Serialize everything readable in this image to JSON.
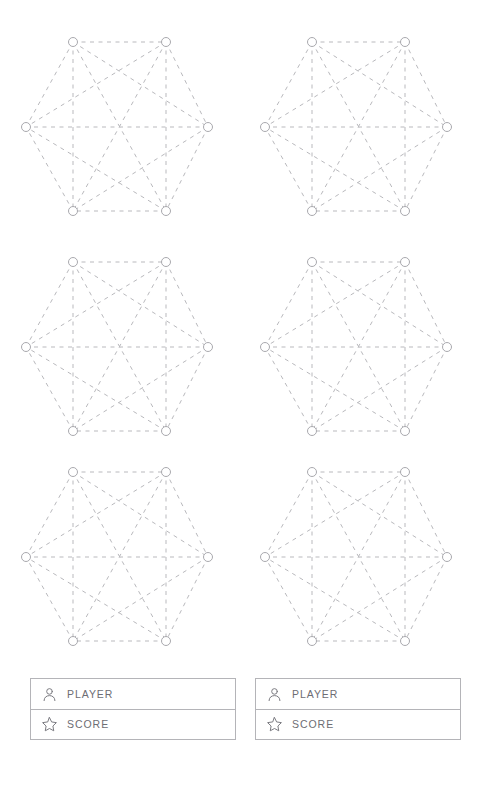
{
  "page": {
    "background_color": "#ffffff",
    "width": 478,
    "height": 792
  },
  "board": {
    "name": "hexagon-graph-board",
    "rows": 3,
    "columns": 2,
    "graph": {
      "type": "complete-graph",
      "label": "K6",
      "vertex_count": 6,
      "edge_count": 15,
      "shape": "hexagon",
      "edge_style": "dashed",
      "edge_color": "#b9b9bd",
      "node_fill": "#ffffff",
      "node_stroke": "#a9a9ae",
      "node_radius": 4.5,
      "vertices": [
        {
          "id": "top-left",
          "x": 73,
          "y": 22
        },
        {
          "id": "top-right",
          "x": 166,
          "y": 22
        },
        {
          "id": "right",
          "x": 208,
          "y": 107
        },
        {
          "id": "bottom-right",
          "x": 166,
          "y": 191
        },
        {
          "id": "bottom-left",
          "x": 73,
          "y": 191
        },
        {
          "id": "left",
          "x": 26,
          "y": 107
        }
      ],
      "edges": [
        [
          0,
          1
        ],
        [
          0,
          2
        ],
        [
          0,
          3
        ],
        [
          0,
          4
        ],
        [
          0,
          5
        ],
        [
          1,
          2
        ],
        [
          1,
          3
        ],
        [
          1,
          4
        ],
        [
          1,
          5
        ],
        [
          2,
          3
        ],
        [
          2,
          4
        ],
        [
          2,
          5
        ],
        [
          3,
          4
        ],
        [
          3,
          5
        ],
        [
          4,
          5
        ]
      ]
    },
    "cells": [
      {
        "id": "hexagon-1",
        "row": 0,
        "column": 0,
        "x": 0,
        "y": 20
      },
      {
        "id": "hexagon-2",
        "row": 0,
        "column": 1,
        "x": 239,
        "y": 20
      },
      {
        "id": "hexagon-3",
        "row": 1,
        "column": 0,
        "x": 0,
        "y": 240
      },
      {
        "id": "hexagon-4",
        "row": 1,
        "column": 1,
        "x": 239,
        "y": 240
      },
      {
        "id": "hexagon-5",
        "row": 2,
        "column": 0,
        "x": 0,
        "y": 450
      },
      {
        "id": "hexagon-6",
        "row": 2,
        "column": 1,
        "x": 239,
        "y": 450
      }
    ]
  },
  "panels": [
    {
      "id": "scoreboard-left",
      "rows": [
        {
          "icon": "person-icon",
          "label": "PLAYER"
        },
        {
          "icon": "star-icon",
          "label": "SCORE"
        }
      ]
    },
    {
      "id": "scoreboard-right",
      "rows": [
        {
          "icon": "person-icon",
          "label": "PLAYER"
        },
        {
          "icon": "star-icon",
          "label": "SCORE"
        }
      ]
    }
  ],
  "style": {
    "label_color": "#6d6d73",
    "icon_color": "#78787e",
    "panel_border_color": "#b4b4b8"
  }
}
